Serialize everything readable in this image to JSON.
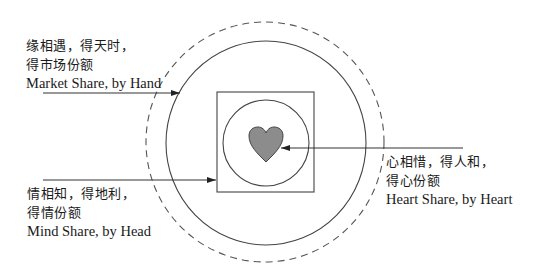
{
  "diagram": {
    "labels": {
      "market": {
        "zh_line1": "缘相遇，得天时，",
        "zh_line2": "得市场份额",
        "en": "Market Share, by Hand"
      },
      "mind": {
        "zh_line1": "情相知，得地利，",
        "zh_line2": "得情份额",
        "en": "Mind Share, by Head"
      },
      "heart": {
        "zh_line1": "心相惜，得人和，",
        "zh_line2": "得心份额",
        "en": "Heart Share, by Heart"
      }
    },
    "shapes": {
      "outer_dashed_circle": "dashed",
      "outer_solid_circle": "solid",
      "middle_square": "square",
      "inner_circle": "circle",
      "center_heart": "heart"
    },
    "colors": {
      "stroke": "#333333",
      "dashed_stroke": "#555555",
      "heart_fill": "#8c8c8c"
    }
  }
}
